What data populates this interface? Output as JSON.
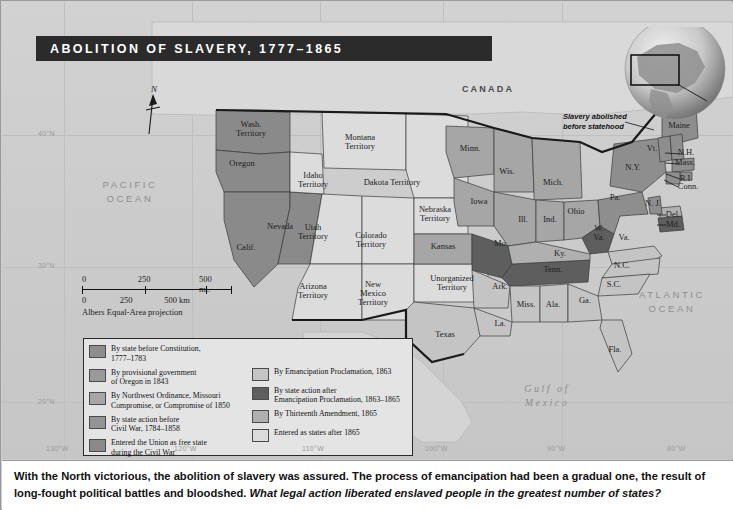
{
  "title": "ABOLITION OF SLAVERY, 1777–1865",
  "annotation": {
    "line1": "Slavery abolished",
    "line2": "before statehood"
  },
  "compass": {
    "north": "N"
  },
  "scale": {
    "miles": [
      "0",
      "250",
      "500 mi."
    ],
    "km": [
      "0",
      "250",
      "500 km"
    ],
    "projection": "Albers Equal-Area projection"
  },
  "graticule": {
    "latitudes": [
      "40°N",
      "30°N",
      "20°N"
    ],
    "longitudes": [
      "130°W",
      "120°W",
      "110°W",
      "100°W",
      "90°W",
      "80°W"
    ]
  },
  "countries": [
    "CANADA",
    "MEXICO"
  ],
  "oceans": {
    "pacific": "PACIFIC\nOCEAN",
    "pacific_l1": "PACIFIC",
    "pacific_l2": "OCEAN",
    "atlantic_l1": "ATLANTIC",
    "atlantic_l2": "OCEAN",
    "gulf_l1": "Gulf  of",
    "gulf_l2": "Mexico"
  },
  "places": [
    {
      "name": "Wash.\nTerritory",
      "l1": "Wash.",
      "l2": "Territory",
      "x": 249,
      "y": 127,
      "cat": "free_civil_war"
    },
    {
      "name": "Oregon",
      "l1": "Oregon",
      "l2": "",
      "x": 240,
      "y": 162,
      "cat": "oregon_provisional"
    },
    {
      "name": "Calif.",
      "l1": "Calif.",
      "l2": "",
      "x": 244,
      "y": 246,
      "cat": "free_civil_war"
    },
    {
      "name": "Nevada",
      "l1": "Nevada",
      "l2": "",
      "x": 278,
      "y": 225,
      "cat": "free_civil_war"
    },
    {
      "name": "Idaho\nTerritory",
      "l1": "Idaho",
      "l2": "Territory",
      "x": 311,
      "y": 178,
      "cat": "after_1865"
    },
    {
      "name": "Montana\nTerritory",
      "l1": "Montana",
      "l2": "Territory",
      "x": 358,
      "y": 140,
      "cat": "after_1865"
    },
    {
      "name": "Utah\nTerritory",
      "l1": "Utah",
      "l2": "Territory",
      "x": 311,
      "y": 230,
      "cat": "after_1865"
    },
    {
      "name": "Colorado\nTerritory",
      "l1": "Colorado",
      "l2": "Territory",
      "x": 369,
      "y": 238,
      "cat": "after_1865"
    },
    {
      "name": "Dakota Territory",
      "l1": "Dakota Territory",
      "l2": "",
      "x": 390,
      "y": 181,
      "cat": "after_1865"
    },
    {
      "name": "Arizona\nTerritory",
      "l1": "Arizona",
      "l2": "Territory",
      "x": 311,
      "y": 289,
      "cat": "after_1865"
    },
    {
      "name": "New\nMexico\nTerritory",
      "l1": "New",
      "l2": "Mexico",
      "l3": "Territory",
      "x": 371,
      "y": 292,
      "cat": "after_1865"
    },
    {
      "name": "Nebraska\nTerritory",
      "l1": "Nebraska",
      "l2": "Territory",
      "x": 433,
      "y": 212,
      "cat": "after_1865"
    },
    {
      "name": "Kansas",
      "l1": "Kansas",
      "l2": "",
      "x": 441,
      "y": 245,
      "cat": "nw_ordinance"
    },
    {
      "name": "Unorganized\nTerritory",
      "l1": "Unorganized",
      "l2": "Territory",
      "x": 450,
      "y": 281,
      "cat": "after_1865"
    },
    {
      "name": "Minn.",
      "l1": "Minn.",
      "l2": "",
      "x": 468,
      "y": 147,
      "cat": "nw_ordinance"
    },
    {
      "name": "Wis.",
      "l1": "Wis.",
      "l2": "",
      "x": 505,
      "y": 170,
      "cat": "nw_ordinance"
    },
    {
      "name": "Iowa",
      "l1": "Iowa",
      "l2": "",
      "x": 477,
      "y": 200,
      "cat": "nw_ordinance"
    },
    {
      "name": "Mich.",
      "l1": "Mich.",
      "l2": "",
      "x": 551,
      "y": 181,
      "cat": "nw_ordinance"
    },
    {
      "name": "Ill.",
      "l1": "Ill.",
      "l2": "",
      "x": 521,
      "y": 218,
      "cat": "nw_ordinance"
    },
    {
      "name": "Ind.",
      "l1": "Ind.",
      "l2": "",
      "x": 548,
      "y": 218,
      "cat": "nw_ordinance"
    },
    {
      "name": "Ohio",
      "l1": "Ohio",
      "l2": "",
      "x": 574,
      "y": 210,
      "cat": "nw_ordinance"
    },
    {
      "name": "Mo.",
      "l1": "Mo.",
      "l2": "",
      "x": 499,
      "y": 242,
      "cat": "state_after_ep"
    },
    {
      "name": "Ky.",
      "l1": "Ky.",
      "l2": "",
      "x": 558,
      "y": 252,
      "cat": "thirteenth"
    },
    {
      "name": "W.\nVa.",
      "l1": "W.",
      "l2": "Va.",
      "x": 597,
      "y": 231,
      "cat": "state_after_ep"
    },
    {
      "name": "Va.",
      "l1": "Va.",
      "l2": "",
      "x": 622,
      "y": 236,
      "cat": "emancipation"
    },
    {
      "name": "Tenn.",
      "l1": "Tenn.",
      "l2": "",
      "x": 551,
      "y": 268,
      "cat": "state_after_ep"
    },
    {
      "name": "N.C.",
      "l1": "N.C.",
      "l2": "",
      "x": 620,
      "y": 264,
      "cat": "emancipation"
    },
    {
      "name": "S.C.",
      "l1": "S.C.",
      "l2": "",
      "x": 612,
      "y": 283,
      "cat": "emancipation"
    },
    {
      "name": "Ark.",
      "l1": "Ark.",
      "l2": "",
      "x": 498,
      "y": 285,
      "cat": "emancipation"
    },
    {
      "name": "Miss.",
      "l1": "Miss.",
      "l2": "",
      "x": 524,
      "y": 303,
      "cat": "emancipation"
    },
    {
      "name": "Ala.",
      "l1": "Ala.",
      "l2": "",
      "x": 551,
      "y": 303,
      "cat": "emancipation"
    },
    {
      "name": "Ga.",
      "l1": "Ga.",
      "l2": "",
      "x": 583,
      "y": 299,
      "cat": "emancipation"
    },
    {
      "name": "La.",
      "l1": "La.",
      "l2": "",
      "x": 498,
      "y": 322,
      "cat": "emancipation"
    },
    {
      "name": "Fla.",
      "l1": "Fla.",
      "l2": "",
      "x": 613,
      "y": 348,
      "cat": "emancipation"
    },
    {
      "name": "Texas",
      "l1": "Texas",
      "l2": "",
      "x": 443,
      "y": 333,
      "cat": "emancipation"
    },
    {
      "name": "Pa.",
      "l1": "Pa.",
      "l2": "",
      "x": 613,
      "y": 196,
      "cat": "state_before_const"
    },
    {
      "name": "N.Y.",
      "l1": "N.Y.",
      "l2": "",
      "x": 631,
      "y": 166,
      "cat": "state_before_const"
    },
    {
      "name": "Maine",
      "l1": "Maine",
      "l2": "",
      "x": 677,
      "y": 124,
      "cat": "state_before_const"
    },
    {
      "name": "Vt.",
      "l1": "Vt.",
      "l2": "",
      "x": 650,
      "y": 147,
      "cat": "state_before_const"
    },
    {
      "name": "N.H.",
      "l1": "N.H.",
      "l2": "",
      "x": 684,
      "y": 151,
      "cat": "state_before_const"
    },
    {
      "name": "Mass.",
      "l1": "Mass.",
      "l2": "",
      "x": 683,
      "y": 161,
      "cat": "state_before_const"
    },
    {
      "name": "R.I.",
      "l1": "R.I.",
      "l2": "",
      "x": 684,
      "y": 177,
      "cat": "state_before_const"
    },
    {
      "name": "Conn.",
      "l1": "Conn.",
      "l2": "",
      "x": 686,
      "y": 185,
      "cat": "state_before_const"
    },
    {
      "name": "N. J.",
      "l1": "N. J.",
      "l2": "",
      "x": 651,
      "y": 202,
      "cat": "state_before_const"
    },
    {
      "name": "Del.",
      "l1": "Del.",
      "l2": "",
      "x": 671,
      "y": 213,
      "cat": "thirteenth"
    },
    {
      "name": "Md.",
      "l1": "Md.",
      "l2": "",
      "x": 671,
      "y": 223,
      "cat": "state_after_ep"
    }
  ],
  "legend": {
    "left": [
      {
        "swatch": "#8e8e8e",
        "l1": "By state before Constitution,",
        "l2": "1777–1783"
      },
      {
        "swatch": "#9a9a9a",
        "l1": "By provisional government",
        "l2": "of Oregon in 1843"
      },
      {
        "swatch": "#a6a6a6",
        "l1": "By Northwest Ordinance, Missouri",
        "l2": "Compromise, or Compromise of 1850"
      },
      {
        "swatch": "#949494",
        "l1": "By state action before",
        "l2": "Civil War, 1784–1858"
      },
      {
        "swatch": "#8a8a8a",
        "l1": "Entered the Union as free state",
        "l2": "during the Civil War"
      }
    ],
    "right": [
      {
        "swatch": "#c4c4c4",
        "l1": "By Emancipation Proclamation, 1863",
        "l2": ""
      },
      {
        "swatch": "#5e5e5e",
        "l1": "By state action after",
        "l2": "Emancipation Proclamation, 1863–1865"
      },
      {
        "swatch": "#b0b0b0",
        "l1": "By Thirteenth Amendment, 1865",
        "l2": ""
      },
      {
        "swatch": "#dcdcdc",
        "l1": "Entered as states after 1865",
        "l2": ""
      }
    ]
  },
  "caption": {
    "bold": "With the North victorious, the abolition of slavery was assured. The process of emancipation had been a gradual one, the result of long-fought political battles and bloodshed.",
    "question": "What legal action liberated enslaved people in the greatest number of states?"
  },
  "colors": {
    "state_before_const": "#8e8e8e",
    "oregon_provisional": "#9a9a9a",
    "nw_ordinance": "#a6a6a6",
    "state_before_cw": "#949494",
    "free_civil_war": "#8a8a8a",
    "emancipation": "#c4c4c4",
    "state_after_ep": "#5e5e5e",
    "thirteenth": "#b0b0b0",
    "after_1865": "#dcdcdc",
    "banner": "#2b2b2b",
    "ocean": "#cccccc",
    "stroke": "#1a1a1a"
  }
}
